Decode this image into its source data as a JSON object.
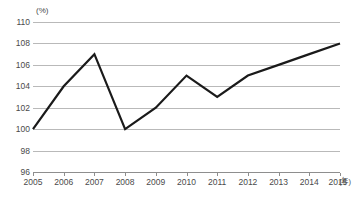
{
  "chart_data": {
    "type": "line",
    "title": "",
    "subtitle": "",
    "xlabel": "(年)",
    "ylabel": "(%)",
    "unit_label": "(%)",
    "x_unit_label": "(年)",
    "categories": [
      "2005",
      "2006",
      "2007",
      "2008",
      "2009",
      "2010",
      "2011",
      "2012",
      "2013",
      "2014",
      "2015"
    ],
    "x": [
      2005,
      2006,
      2007,
      2008,
      2009,
      2010,
      2011,
      2012,
      2013,
      2014,
      2015
    ],
    "values": [
      100,
      104,
      107,
      100,
      102,
      105,
      103,
      105,
      106,
      107,
      108
    ],
    "series": [
      {
        "name": "",
        "values": [
          100,
          104,
          107,
          100,
          102,
          105,
          103,
          105,
          106,
          107,
          108
        ],
        "color": "#1a1a1a"
      }
    ],
    "ylim": [
      96,
      110
    ],
    "y_ticks": [
      110,
      108,
      106,
      104,
      102,
      100,
      98,
      96
    ],
    "y_tick_labels": [
      "110",
      "108",
      "106",
      "104",
      "102",
      "100",
      "98",
      "96"
    ],
    "x_tick_labels": [
      "2005",
      "2006",
      "2007",
      "2008",
      "2009",
      "2010",
      "2011",
      "2012",
      "2013",
      "2014",
      "2015"
    ],
    "grid": true,
    "grid_axis": "y",
    "legend": false,
    "legend_position": "none",
    "annotations": [],
    "colors": {
      "line": "#1a1a1a",
      "grid": "#b9b9b9",
      "axis": "#8e8e8e",
      "text": "#4a4a4a",
      "background": "#ffffff"
    }
  }
}
